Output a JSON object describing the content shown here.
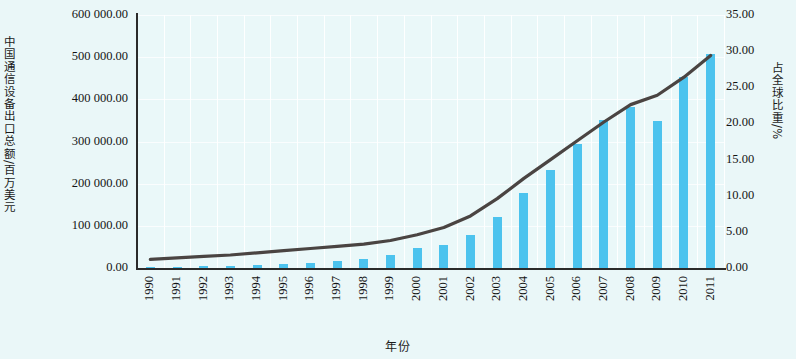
{
  "axes": {
    "y_left_title": "中国通信设备出口总额/百万美元",
    "y_right_title": "占全球比重/%",
    "x_title": "年份",
    "y_left_ticks": [
      "0.00",
      "100 000.00",
      "200 000.00",
      "300 000.00",
      "400 000.00",
      "500 000.00",
      "600 000.00"
    ],
    "y_right_ticks": [
      "0.00",
      "5.00",
      "10.00",
      "15.00",
      "20.00",
      "25.00",
      "30.00",
      "35.00"
    ]
  },
  "colors": {
    "bar": "#4cc3ee",
    "line": "#4a4442",
    "plot_background": "#eaf8f9",
    "page_background": "#eaf7f8",
    "grid": "#ffffff",
    "axis": "#2b2b2b"
  },
  "chart_data": {
    "type": "bar",
    "title": "",
    "xlabel": "年份",
    "ylabel": "中国通信设备出口总额/百万美元",
    "y2label": "占全球比重/%",
    "grid": true,
    "legend": "none",
    "ylim": [
      0,
      600000
    ],
    "y2lim": [
      0,
      35
    ],
    "ytick_step": 100000,
    "y2tick_step": 5,
    "categories": [
      "1990",
      "1991",
      "1992",
      "1993",
      "1994",
      "1995",
      "1996",
      "1997",
      "1998",
      "1999",
      "2000",
      "2001",
      "2002",
      "2003",
      "2004",
      "2005",
      "2006",
      "2007",
      "2008",
      "2009",
      "2010",
      "2011"
    ],
    "series": [
      {
        "name": "中国通信设备出口总额/百万美元",
        "type": "bar",
        "axis": "left",
        "values": [
          2000,
          3000,
          4000,
          5000,
          7000,
          10000,
          13000,
          17000,
          21000,
          30000,
          47000,
          55000,
          78000,
          122000,
          177000,
          232000,
          293000,
          350000,
          383000,
          348000,
          452000,
          507000
        ]
      },
      {
        "name": "占全球比重/%",
        "type": "line",
        "axis": "right",
        "values": [
          1.2,
          1.4,
          1.6,
          1.8,
          2.1,
          2.4,
          2.7,
          3.0,
          3.3,
          3.8,
          4.6,
          5.6,
          7.2,
          9.6,
          12.4,
          15.0,
          17.6,
          20.2,
          22.6,
          23.9,
          26.4,
          29.4
        ]
      }
    ]
  }
}
